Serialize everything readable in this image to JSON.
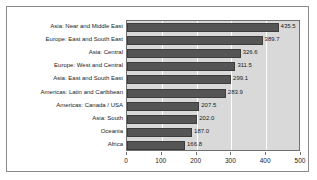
{
  "chart_data": {
    "type": "bar",
    "orientation": "horizontal",
    "title": "",
    "xlabel": "",
    "ylabel": "",
    "xlim": [
      0,
      500
    ],
    "xticks": [
      "0",
      "100",
      "200",
      "300",
      "400",
      "500"
    ],
    "grid": true,
    "legend": "none",
    "plot_background": "#d9d9d9",
    "bar_color": "#555555",
    "categories": [
      "Asia: Near and Middle East",
      "Europe: East and South East",
      "Asia: Central",
      "Europe: West and Central",
      "Asia: East and South East",
      "Americas: Latin and Caribbean",
      "Americas: Canada / USA",
      "Asia: South",
      "Oceania",
      "Africa"
    ],
    "values": [
      435.5,
      389.7,
      326.6,
      311.5,
      299.1,
      283.9,
      207.5,
      202.0,
      187.0,
      166.8
    ],
    "value_labels": [
      "435.5",
      "389.7",
      "326.6",
      "311.5",
      "299.1",
      "283.9",
      "207.5",
      "202.0",
      "187.0",
      "166.8"
    ]
  }
}
